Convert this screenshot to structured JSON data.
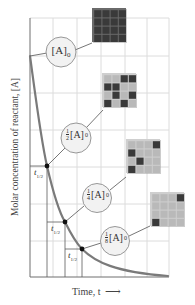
{
  "diagram": {
    "type": "first-order-decay-half-life",
    "y_axis_label": "Molar concentration of reactant, [A]",
    "x_axis_label": "Time, t",
    "x_axis_arrow": "right-arrow",
    "half_life_label": "t",
    "half_life_subscript": "1/2",
    "colors": {
      "curve": "#7a7a7a",
      "grid": "#dcdcdc",
      "axis": "#6e6e6e",
      "circle_fill": "#f2f2f2",
      "circle_stroke": "#8c8c8c",
      "dark_cell": "#3a3a3a",
      "light_cell": "#b9b9b9",
      "grid_box_bg": "#cfcfcf",
      "dot": "#111111"
    },
    "stages": [
      {
        "label_fraction": "",
        "label_main": "[A]",
        "label_sub": "0",
        "fraction": 1,
        "dark_cells": [
          [
            0,
            0
          ],
          [
            0,
            1
          ],
          [
            0,
            2
          ],
          [
            0,
            3
          ],
          [
            1,
            0
          ],
          [
            1,
            1
          ],
          [
            1,
            2
          ],
          [
            1,
            3
          ],
          [
            2,
            0
          ],
          [
            2,
            1
          ],
          [
            2,
            2
          ],
          [
            2,
            3
          ],
          [
            3,
            0
          ],
          [
            3,
            1
          ],
          [
            3,
            2
          ],
          [
            3,
            3
          ]
        ]
      },
      {
        "label_fraction_num": "1",
        "label_fraction_den": "2",
        "label_main": "[A]",
        "label_sub": "0",
        "fraction": 0.5,
        "dark_cells": [
          [
            0,
            2
          ],
          [
            0,
            3
          ],
          [
            1,
            0
          ],
          [
            1,
            1
          ],
          [
            2,
            1
          ],
          [
            2,
            3
          ],
          [
            3,
            0
          ],
          [
            3,
            2
          ]
        ]
      },
      {
        "label_fraction_num": "1",
        "label_fraction_den": "4",
        "label_main": "[A]",
        "label_sub": "0",
        "fraction": 0.25,
        "dark_cells": [
          [
            0,
            3
          ],
          [
            1,
            0
          ],
          [
            2,
            1
          ],
          [
            3,
            0
          ]
        ]
      },
      {
        "label_fraction_num": "1",
        "label_fraction_den": "8",
        "label_main": "[A]",
        "label_sub": "0",
        "fraction": 0.125,
        "dark_cells": [
          [
            0,
            3
          ],
          [
            3,
            0
          ]
        ]
      }
    ]
  }
}
